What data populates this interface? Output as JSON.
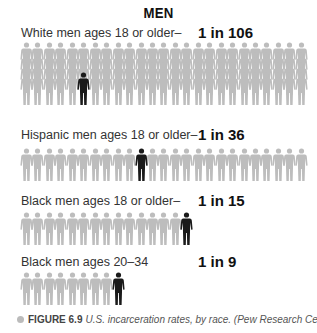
{
  "header": {
    "title": "MEN"
  },
  "colors": {
    "background": "#ffffff",
    "figure_gray": "#bdbdbd",
    "figure_highlight": "#1a1a1a"
  },
  "rows": [
    {
      "label": "White men ages 18 or older–",
      "rate": "1 in 106",
      "ratio": 106
    },
    {
      "label": "Hispanic men ages 18 or older–",
      "rate": "1 in 36",
      "ratio": 36
    },
    {
      "label": "Black men ages 18 or older–",
      "rate": "1 in 15",
      "ratio": 15
    },
    {
      "label": "Black men ages 20–34",
      "rate": "1 in 9",
      "ratio": 9
    }
  ],
  "caption": {
    "figure_number": "FIGURE 6.9",
    "text": "U.S. incarceration rates, by race. (Pew Research Center)"
  },
  "chart_data": {
    "type": "pictograph",
    "title": "MEN",
    "categories": [
      "White men ages 18 or older",
      "Hispanic men ages 18 or older",
      "Black men ages 18 or older",
      "Black men ages 20–34"
    ],
    "values": [
      106,
      36,
      15,
      9
    ],
    "value_labels": [
      "1 in 106",
      "1 in 36",
      "1 in 15",
      "1 in 9"
    ],
    "unit": "1 in N incarcerated",
    "legend": {
      "gray_figure": "not incarcerated",
      "black_figure": "incarcerated"
    },
    "caption": "FIGURE 6.9 U.S. incarceration rates, by race. (Pew Research Center)"
  }
}
